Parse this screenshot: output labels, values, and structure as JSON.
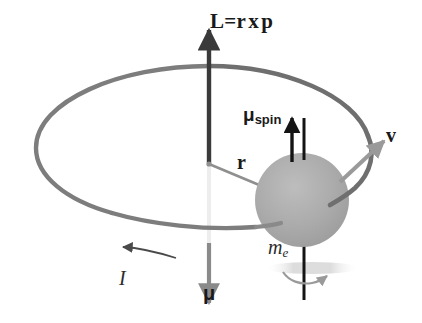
{
  "figure": {
    "background_color": "#ffffff",
    "width": 422,
    "height": 323
  },
  "colors": {
    "ring": "#7d7d7d",
    "axis_upper": "#3a3a3a",
    "axis_lower": "#8a8a8a",
    "axis_hidden": "#ededed",
    "sphere": "#a9a9a9",
    "spin_axis": "#141414",
    "velocity_arrow": "#9a9a9a",
    "radius_line": "#8f8f8f",
    "current_arrow": "#4a4a4a",
    "shadow": "#d5d5d5",
    "text": "#1a1a1a"
  },
  "labels": {
    "angular_momentum": {
      "symbol": "L",
      "equals": "=",
      "r": "r",
      "cross": "x",
      "p": "p",
      "full": "L=r x p"
    },
    "spin_moment": {
      "base": "μ",
      "subscript": "spin",
      "full": "μspin"
    },
    "velocity": "v",
    "radius": "r",
    "electron_mass": {
      "base": "m",
      "subscript": "e",
      "full": "me"
    },
    "current": "I",
    "magnetic_moment": "μ"
  },
  "elements": {
    "orbit_ring": "elliptical orbit loop",
    "electron_sphere": "shaded gray sphere representing the electron",
    "vertical_axis": "vertical angular-momentum axis line",
    "spin_axis": "vertical spin axis through the electron",
    "radius_vector": "line from orbit center to the electron",
    "current_arrow": "curved arrow indicating current direction along the ring",
    "spin_rotation_arrow": "small curved arrow indicating electron spin",
    "shadow_ellipse": "soft shadow beneath the electron"
  }
}
